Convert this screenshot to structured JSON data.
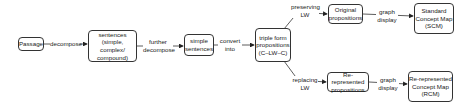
{
  "nodes": {
    "passage": "Passage",
    "sentences": "sentences\n(simple, complex/\ncompound)",
    "simple_sentences": "simple\nsentences",
    "triple_form": "triple form\npropositions\n(C–LW–C)",
    "original_propositions": "Original\npropositions",
    "scm": "Standard\nConcept Map\n(SCM)",
    "rerepresented_propositions": "Re-represented\npropositions",
    "rcm": "Re-represented\nConcept Map\n(RCM)"
  },
  "edges": {
    "decompose": "decompose",
    "further_decompose": "further\ndecompose",
    "convert_into": "convert\ninto",
    "preserving_lw": "preserving\nLW",
    "replacing_lw": "replacing\nLW",
    "graph_display_top": "graph\ndisplay",
    "graph_display_bottom": "graph\ndisplay"
  },
  "colors": {
    "stroke": "#333333",
    "background": "#ffffff"
  }
}
